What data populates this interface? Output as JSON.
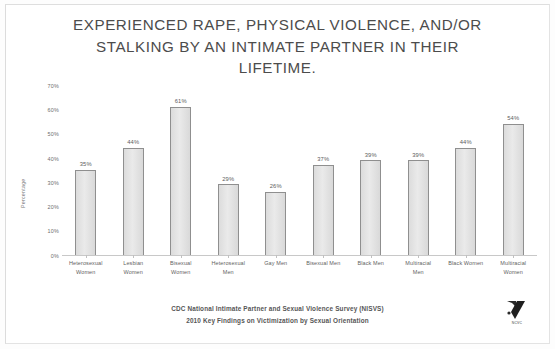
{
  "title": "EXPERIENCED RAPE, PHYSICAL VIOLENCE, AND/OR STALKING BY AN INTIMATE PARTNER IN THEIR LIFETIME.",
  "footer": {
    "line1": "CDC National Intimate Partner and Sexual Violence Survey (NISVS)",
    "line2": "2010 Key Findings on Victimization by Sexual Orientation"
  },
  "logo": {
    "name": "organization-logo",
    "caption": "NCVC"
  },
  "colors": {
    "bar_fill": "#e3e3e3",
    "bar_border": "#8f8f8f",
    "text": "#4c4c4c",
    "axis": "#c8c8c8",
    "background": "#ffffff"
  },
  "chart_data": {
    "type": "bar",
    "title": "EXPERIENCED RAPE, PHYSICAL VIOLENCE, AND/OR STALKING BY AN INTIMATE PARTNER IN THEIR LIFETIME.",
    "xlabel": "",
    "ylabel": "Percentage",
    "ylim": [
      0,
      70
    ],
    "yticks": [
      "0%",
      "10%",
      "20%",
      "30%",
      "40%",
      "50%",
      "60%",
      "70%"
    ],
    "ytick_values": [
      0,
      10,
      20,
      30,
      40,
      50,
      60,
      70
    ],
    "grid": false,
    "legend": false,
    "categories": [
      "Heterosexual Women",
      "Lesbian Women",
      "Bisexual Women",
      "Heterosexual Men",
      "Gay Men",
      "Bisexual Men",
      "Black Men",
      "Multiracial Men",
      "Black Women",
      "Multiracial Women"
    ],
    "category_lines": [
      [
        "Heterosexual",
        "Women"
      ],
      [
        "Lesbian",
        "Women"
      ],
      [
        "Bisexual",
        "Women"
      ],
      [
        "Heterosexual",
        "Men"
      ],
      [
        "Gay Men"
      ],
      [
        "Bisexual Men"
      ],
      [
        "Black Men"
      ],
      [
        "Multiracial",
        "Men"
      ],
      [
        "Black Women"
      ],
      [
        "Multiracial",
        "Women"
      ]
    ],
    "values": [
      35,
      44,
      61,
      29,
      26,
      37,
      39,
      39,
      44,
      54
    ],
    "data_labels": [
      "35%",
      "44%",
      "61%",
      "29%",
      "26%",
      "37%",
      "39%",
      "39%",
      "44%",
      "54%"
    ]
  }
}
